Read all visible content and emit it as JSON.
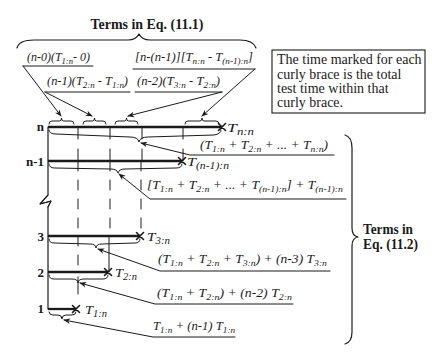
{
  "figure": {
    "top_title": "Terms in Eq. (11.1)",
    "top_terms": [
      "(n-0)(T_{1:n}- 0)",
      "[n-(n-1)][T_{n:n} - T_{(n-1):n}]",
      "(n-1)(T_{2:n} - T_{1:n})",
      "(n-2)(T_{3:n} - T_{2:n})"
    ],
    "note": {
      "lines": [
        "The time marked for each",
        "curly brace is the total",
        "test time within that",
        "curly brace."
      ]
    },
    "levels": [
      {
        "label": "n",
        "time": "T_{n:n}",
        "term": "(T_{1:n} + T_{2:n} + ... + T_{n:n})"
      },
      {
        "label": "n-1",
        "time": "T_{(n-1):n}",
        "term": "[T_{1:n} + T_{2:n} + ... + T_{(n-1):n}] + T_{(n-1):n}"
      },
      {
        "label": "3",
        "time": "T_{3:n}",
        "term": "(T_{1:n} + T_{2:n} + T_{3:n}) + (n-3) T_{3:n}"
      },
      {
        "label": "2",
        "time": "T_{2:n}",
        "term": "(T_{1:n} + T_{2:n}) + (n-2) T_{2:n}"
      },
      {
        "label": "1",
        "time": "T_{1:n}",
        "term": "T_{1:n} + (n-1) T_{1:n}"
      }
    ],
    "right_title": {
      "line1": "Terms in",
      "line2": "Eq. (11.2)"
    },
    "colors": {
      "ink": "#1a1a1a",
      "background": "#ffffff"
    }
  }
}
